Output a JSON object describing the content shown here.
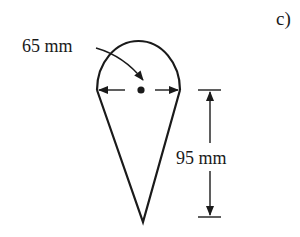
{
  "figure": {
    "label": "c)",
    "shape": "circle-on-inverted-triangle (ice-cream cone profile)",
    "dimensions": {
      "diameter": {
        "value": 65,
        "unit": "mm",
        "text": "65 mm"
      },
      "height": {
        "value": 95,
        "unit": "mm",
        "text": "95 mm"
      }
    },
    "colors": {
      "stroke": "#1a1a1a",
      "background": "#ffffff"
    }
  }
}
